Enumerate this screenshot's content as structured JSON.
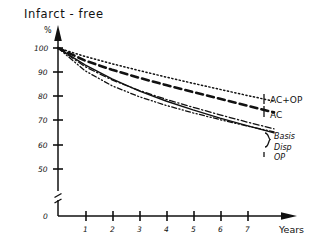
{
  "chart_data": {
    "type": "line",
    "title": "Infarct - free",
    "ylabel": "%",
    "xlabel": "Years",
    "xlim": [
      0,
      8
    ],
    "ylim": [
      50,
      100
    ],
    "y_axis_break": true,
    "y_break_label": "0",
    "grid": false,
    "legend_position": "right-inline",
    "x_ticks": [
      "1",
      "2",
      "3",
      "4",
      "5",
      "6",
      "7"
    ],
    "x_tick_values": [
      1,
      2,
      3,
      4,
      5,
      6,
      7
    ],
    "y_ticks": [
      "100",
      "90",
      "80",
      "70",
      "60",
      "50"
    ],
    "y_tick_values": [
      100,
      90,
      80,
      70,
      60,
      50
    ],
    "x": [
      0,
      1,
      2,
      3,
      4,
      5,
      6,
      7,
      8
    ],
    "series": [
      {
        "name": "AC+OP",
        "style": "dotted",
        "color": "#111111",
        "values": [
          100,
          96.5,
          93.5,
          90.7,
          88.0,
          85.4,
          82.9,
          80.4,
          78.0
        ]
      },
      {
        "name": "AC",
        "style": "dashed",
        "color": "#111111",
        "values": [
          100,
          94.8,
          91.0,
          87.7,
          84.7,
          81.8,
          79.0,
          76.2,
          73.4
        ]
      },
      {
        "name": "Basis",
        "style": "dash-dot",
        "color": "#111111",
        "values": [
          100,
          92.3,
          86.8,
          82.5,
          78.8,
          75.5,
          72.4,
          69.4,
          66.6
        ]
      },
      {
        "name": "Disp",
        "style": "dash-dot-dot",
        "color": "#111111",
        "values": [
          100,
          90.6,
          84.4,
          79.9,
          76.3,
          73.2,
          70.4,
          67.8,
          65.3
        ]
      },
      {
        "name": "OP",
        "style": "solid",
        "color": "#111111",
        "values": [
          100,
          93.0,
          87.2,
          82.3,
          78.1,
          74.4,
          71.0,
          67.9,
          64.9
        ]
      }
    ]
  },
  "chart": {
    "title": "Infarct - free",
    "y_axis_unit": "%",
    "x_axis_title": "Years",
    "zero_label": "0",
    "y_tick_100": "100",
    "y_tick_90": "90",
    "y_tick_80": "80",
    "y_tick_70": "70",
    "y_tick_60": "60",
    "y_tick_50": "50",
    "x_tick_1": "1",
    "x_tick_2": "2",
    "x_tick_3": "3",
    "x_tick_4": "4",
    "x_tick_5": "5",
    "x_tick_6": "6",
    "x_tick_7": "7",
    "legend": {
      "ac_op": "AC+OP",
      "ac": "AC",
      "basis": "Basis",
      "disp": "Disp",
      "op": "OP"
    }
  }
}
